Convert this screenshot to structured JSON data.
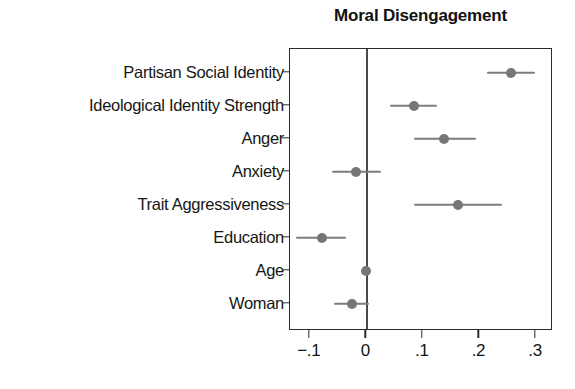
{
  "chart_data": {
    "type": "scatter",
    "title": "Moral Disengagement",
    "xlabel": "",
    "ylabel": "",
    "orientation": "horizontal",
    "grid": false,
    "legend": null,
    "xlim": [
      -0.135,
      0.33
    ],
    "x_ticks": [
      -0.1,
      0,
      0.1,
      0.2,
      0.3
    ],
    "x_tick_labels": [
      "−.1",
      "0",
      ".1",
      ".2",
      ".3"
    ],
    "reference_line": 0,
    "categories": [
      "Partisan Social Identity",
      "Ideological Identity Strength",
      "Anger",
      "Anxiety",
      "Trait Aggressiveness",
      "Education",
      "Age",
      "Woman"
    ],
    "values": [
      0.256,
      0.085,
      0.138,
      -0.019,
      0.162,
      -0.079,
      0.0,
      -0.025
    ],
    "ci_low": [
      0.213,
      0.041,
      0.085,
      -0.06,
      0.085,
      -0.125,
      -0.004,
      -0.057
    ],
    "ci_high": [
      0.299,
      0.125,
      0.193,
      0.026,
      0.239,
      -0.036,
      0.006,
      0.004
    ],
    "marker_color": "#767676",
    "ci_color": "#7d7d7d",
    "frame_color": "#2b2b2b"
  },
  "figure": {
    "title": "Moral Disengagement"
  }
}
